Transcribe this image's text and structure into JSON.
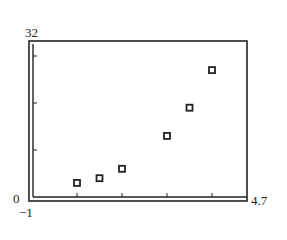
{
  "chart_data": {
    "type": "scatter",
    "title": "",
    "xlabel": "",
    "ylabel": "",
    "xlim": [
      -1,
      4.7
    ],
    "ylim": [
      0,
      32
    ],
    "xscl": 1,
    "yscl": 10,
    "grid": false,
    "legend": null,
    "window_labels": {
      "xmin": "−1",
      "xmax": "4.7",
      "ymin": "0",
      "ymax": "32"
    },
    "marker": "hollow-square",
    "series": [
      {
        "name": "data",
        "x": [
          1,
          1.5,
          2,
          3,
          3.5,
          4
        ],
        "y": [
          3,
          4,
          6,
          13,
          19,
          27
        ]
      }
    ]
  },
  "colors": {
    "ink": "#222222",
    "background": "#ffffff"
  }
}
